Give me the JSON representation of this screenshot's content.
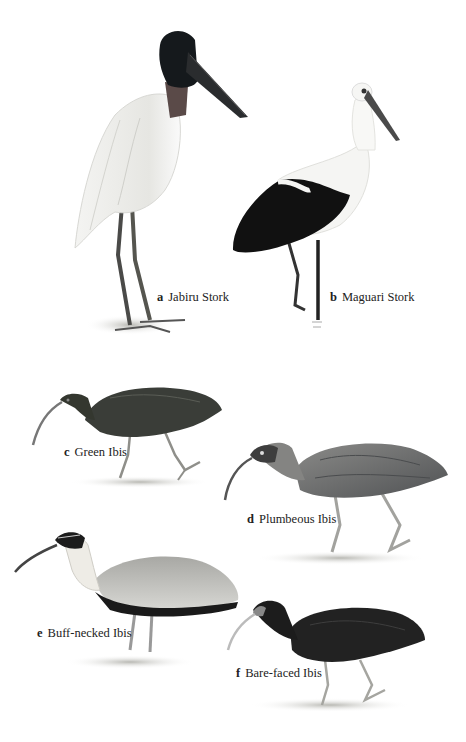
{
  "plate": {
    "background": "#ffffff",
    "birds": [
      {
        "letter": "a",
        "name": "Jabiru Stork"
      },
      {
        "letter": "b",
        "name": "Maguari Stork"
      },
      {
        "letter": "c",
        "name": "Green Ibis"
      },
      {
        "letter": "d",
        "name": "Plumbeous Ibis"
      },
      {
        "letter": "e",
        "name": "Buff-necked Ibis"
      },
      {
        "letter": "f",
        "name": "Bare-faced Ibis"
      }
    ]
  },
  "colors": {
    "jabiru_head": "#15191c",
    "jabiru_neck_collar": "#5a4a48",
    "maguari_wing": "#111111",
    "green_ibis_body": "#3a3d38",
    "plumbeous_body": "#6a6c6e",
    "buff_neck": "#e8e6e0",
    "bare_faced_body": "#222222",
    "legs": "#9a9a96"
  }
}
